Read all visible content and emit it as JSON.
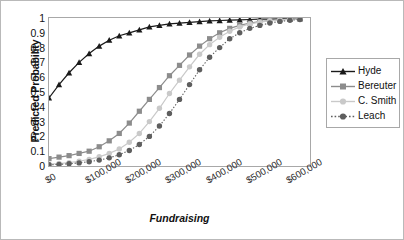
{
  "chart_data": {
    "type": "line",
    "title": "",
    "xlabel": "Fundraising",
    "ylabel": "Predicted Probability",
    "xlim": [
      0,
      650000
    ],
    "ylim": [
      0,
      1
    ],
    "grid": false,
    "legend_position": "right",
    "x_tick_labels": [
      "$0",
      "$100,000",
      "$200,000",
      "$300,000",
      "$400,000",
      "$500,000",
      "$600,000"
    ],
    "x_tick_values": [
      0,
      100000,
      200000,
      300000,
      400000,
      500000,
      600000
    ],
    "y_tick_labels": [
      "0",
      "0.1",
      "0.2",
      "0.3",
      "0.4",
      "0.5",
      "0.6",
      "0.7",
      "0.8",
      "0.9",
      "1"
    ],
    "y_tick_values": [
      0,
      0.1,
      0.2,
      0.3,
      0.4,
      0.5,
      0.6,
      0.7,
      0.8,
      0.9,
      1
    ],
    "x": [
      0,
      25000,
      50000,
      75000,
      100000,
      125000,
      150000,
      175000,
      200000,
      225000,
      250000,
      275000,
      300000,
      325000,
      350000,
      375000,
      400000,
      425000,
      450000,
      475000,
      500000,
      525000,
      550000,
      575000,
      600000,
      625000
    ],
    "series": [
      {
        "name": "Hyde",
        "color": "#1a1a1a",
        "marker": "triangle",
        "dash": "solid",
        "values": [
          0.46,
          0.55,
          0.63,
          0.7,
          0.76,
          0.81,
          0.85,
          0.88,
          0.9,
          0.92,
          0.94,
          0.95,
          0.96,
          0.965,
          0.97,
          0.975,
          0.98,
          0.983,
          0.986,
          0.988,
          0.99,
          0.992,
          0.993,
          0.994,
          0.995,
          0.996
        ]
      },
      {
        "name": "Bereuter",
        "color": "#8c8c8c",
        "marker": "square",
        "dash": "solid",
        "values": [
          0.05,
          0.06,
          0.07,
          0.085,
          0.1,
          0.13,
          0.17,
          0.22,
          0.29,
          0.37,
          0.45,
          0.53,
          0.61,
          0.68,
          0.75,
          0.81,
          0.86,
          0.9,
          0.93,
          0.95,
          0.965,
          0.975,
          0.982,
          0.988,
          0.992,
          0.995
        ]
      },
      {
        "name": "C. Smith",
        "color": "#c9c9c9",
        "marker": "circle",
        "dash": "solid",
        "values": [
          0.012,
          0.017,
          0.023,
          0.032,
          0.045,
          0.062,
          0.085,
          0.115,
          0.16,
          0.22,
          0.3,
          0.39,
          0.49,
          0.58,
          0.67,
          0.755,
          0.82,
          0.87,
          0.91,
          0.94,
          0.96,
          0.972,
          0.981,
          0.987,
          0.991,
          0.994
        ]
      },
      {
        "name": "Leach",
        "color": "#5e5e5e",
        "marker": "circle",
        "dash": "dotted",
        "values": [
          0.008,
          0.011,
          0.015,
          0.021,
          0.029,
          0.04,
          0.055,
          0.076,
          0.105,
          0.145,
          0.2,
          0.27,
          0.355,
          0.45,
          0.55,
          0.65,
          0.735,
          0.8,
          0.86,
          0.9,
          0.93,
          0.95,
          0.966,
          0.977,
          0.984,
          0.99
        ]
      }
    ]
  }
}
